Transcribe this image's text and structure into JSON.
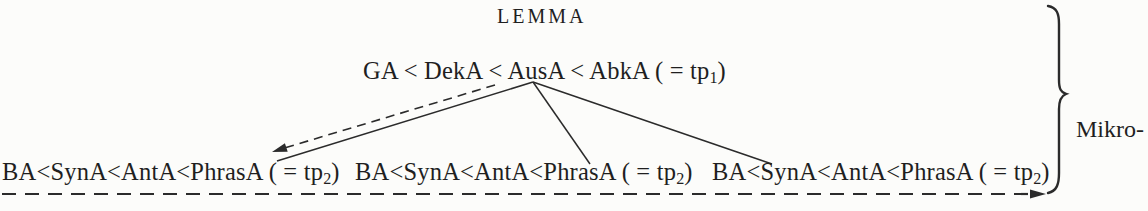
{
  "lemma": "LEMMA",
  "top_formula": {
    "body": "GA < DekA < AusA < AbkA ( = tp",
    "sub": "1",
    "suffix": ")"
  },
  "bottom_formulas": [
    {
      "body": "BA<SynA<AntA<PhrasA ( = tp",
      "sub": "2",
      "suffix": ")"
    },
    {
      "body": "BA<SynA<AntA<PhrasA ( = tp",
      "sub": "2",
      "suffix": ")"
    },
    {
      "body": "BA<SynA<AntA<PhrasA ( = tp",
      "sub": "2",
      "suffix": ")"
    }
  ],
  "brace_label": {
    "lines": [
      "Mikro-",
      "struk-",
      "tur"
    ]
  },
  "colors": {
    "background": "#fcfcfa",
    "ink": "#1f1f1f",
    "line": "#2b2b2b"
  }
}
